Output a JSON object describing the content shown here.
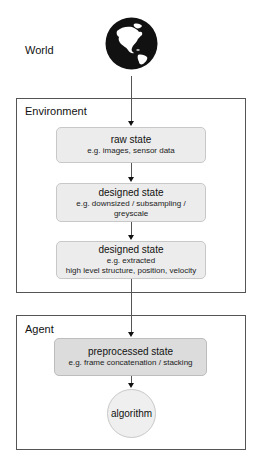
{
  "world": {
    "label": "World",
    "icon": "globe-americas-icon"
  },
  "environment": {
    "label": "Environment",
    "states": [
      {
        "title": "raw state",
        "subtitle": [
          "e.g. images, sensor data"
        ]
      },
      {
        "title": "designed state",
        "subtitle": [
          "e.g. downsized / subsampling /",
          "greyscale"
        ]
      },
      {
        "title": "designed state",
        "subtitle": [
          "e.g. extracted",
          "high level structure, position, velocity"
        ]
      }
    ]
  },
  "agent": {
    "label": "Agent",
    "preprocessed": {
      "title": "preprocessed state",
      "subtitle": [
        "e.g. frame concatenation / stacking"
      ]
    },
    "algorithm": {
      "label": "algorithm"
    }
  },
  "colors": {
    "frame_border": "#555555",
    "state_fill": "#ececec",
    "preprocessed_fill": "#dcdcdc",
    "circle_fill": "#efefef",
    "globe": "#111111"
  }
}
